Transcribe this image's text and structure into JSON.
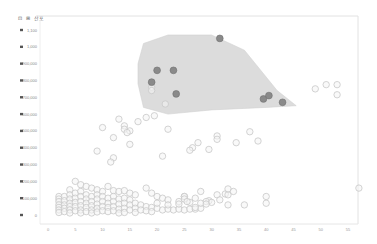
{
  "toolbar": {
    "buttons": [
      {
        "name": "select-tool",
        "icon": "cursor-icon",
        "glyph": "⊡"
      },
      {
        "name": "zoom-tool",
        "icon": "zoom-icon",
        "glyph": "⊞"
      },
      {
        "name": "chart-type",
        "icon": "scatter-icon",
        "label": "산포"
      }
    ]
  },
  "chart_data": {
    "type": "scatter",
    "title": "",
    "xlabel": "",
    "ylabel": "",
    "xlim": [
      0,
      55
    ],
    "ylim": [
      0,
      1100000
    ],
    "x_ticks": [
      0,
      5,
      10,
      15,
      20,
      25,
      30,
      35,
      40,
      45,
      50,
      55
    ],
    "x_tick_labels": [
      "0",
      "5",
      "10",
      "15",
      "20",
      "25",
      "30",
      "35",
      "40",
      "45",
      "50",
      "55"
    ],
    "y_ticks": [
      0,
      100000,
      200000,
      300000,
      400000,
      500000,
      600000,
      700000,
      800000,
      900000,
      1000000,
      1100000
    ],
    "y_tick_labels": [
      "0",
      "100,000",
      "200,000",
      "300,000",
      "400,000",
      "500,000",
      "600,000",
      "700,000",
      "800,000",
      "900,000",
      "1,000",
      "1,100"
    ],
    "grid": false,
    "legend": "none",
    "colors": {
      "point_fill": "#f4f4f4",
      "point_stroke": "#c8c8c8",
      "highlight_fill": "#8a8a8a",
      "highlight_stroke": "#707070",
      "hull_fill": "#dcdcdc"
    },
    "highlight_hull": [
      [
        17.5,
        1020000
      ],
      [
        22,
        1070000
      ],
      [
        30,
        1070000
      ],
      [
        36,
        980000
      ],
      [
        42,
        740000
      ],
      [
        45.5,
        650000
      ],
      [
        40,
        640000
      ],
      [
        30,
        625000
      ],
      [
        22,
        600000
      ],
      [
        17.5,
        640000
      ],
      [
        16.5,
        780000
      ],
      [
        16.5,
        900000
      ]
    ],
    "highlight_points": [
      [
        31.5,
        1050000
      ],
      [
        20,
        860000
      ],
      [
        23,
        860000
      ],
      [
        19,
        790000
      ],
      [
        23.5,
        720000
      ],
      [
        39.5,
        690000
      ],
      [
        40.5,
        710000
      ],
      [
        43,
        670000
      ]
    ],
    "series": [
      {
        "name": "points",
        "points": [
          [
            19,
            760000
          ],
          [
            19,
            740000
          ],
          [
            21.5,
            660000
          ],
          [
            49,
            750000
          ],
          [
            51,
            775000
          ],
          [
            53,
            775000
          ],
          [
            53,
            715000
          ],
          [
            18,
            580000
          ],
          [
            19.5,
            590000
          ],
          [
            13,
            570000
          ],
          [
            16.5,
            555000
          ],
          [
            10,
            520000
          ],
          [
            14,
            530000
          ],
          [
            14,
            510000
          ],
          [
            15,
            500000
          ],
          [
            14.5,
            490000
          ],
          [
            22,
            510000
          ],
          [
            31,
            470000
          ],
          [
            34.5,
            430000
          ],
          [
            38.5,
            440000
          ],
          [
            37,
            495000
          ],
          [
            27.5,
            430000
          ],
          [
            26.5,
            400000
          ],
          [
            26,
            385000
          ],
          [
            29.5,
            390000
          ],
          [
            21,
            350000
          ],
          [
            31,
            450000
          ],
          [
            12,
            460000
          ],
          [
            15,
            420000
          ],
          [
            9,
            380000
          ],
          [
            12,
            340000
          ],
          [
            11.5,
            315000
          ],
          [
            5,
            200000
          ],
          [
            6,
            180000
          ],
          [
            7,
            170000
          ],
          [
            4,
            150000
          ],
          [
            8,
            160000
          ],
          [
            9,
            150000
          ],
          [
            10,
            140000
          ],
          [
            12,
            145000
          ],
          [
            13,
            140000
          ],
          [
            11,
            170000
          ],
          [
            14,
            145000
          ],
          [
            15,
            130000
          ],
          [
            16,
            120000
          ],
          [
            18,
            160000
          ],
          [
            19,
            130000
          ],
          [
            20,
            110000
          ],
          [
            21,
            100000
          ],
          [
            22,
            90000
          ],
          [
            24,
            80000
          ],
          [
            25,
            110000
          ],
          [
            27,
            100000
          ],
          [
            28,
            140000
          ],
          [
            2,
            110000
          ],
          [
            2,
            95000
          ],
          [
            2,
            80000
          ],
          [
            2,
            60000
          ],
          [
            2,
            45000
          ],
          [
            2,
            30000
          ],
          [
            2,
            15000
          ],
          [
            3,
            110000
          ],
          [
            3,
            85000
          ],
          [
            3,
            60000
          ],
          [
            3,
            40000
          ],
          [
            3,
            20000
          ],
          [
            4,
            120000
          ],
          [
            4,
            95000
          ],
          [
            4,
            70000
          ],
          [
            4,
            50000
          ],
          [
            4,
            30000
          ],
          [
            4,
            12000
          ],
          [
            5,
            130000
          ],
          [
            5,
            100000
          ],
          [
            5,
            75000
          ],
          [
            5,
            50000
          ],
          [
            5,
            25000
          ],
          [
            6,
            140000
          ],
          [
            6,
            110000
          ],
          [
            6,
            80000
          ],
          [
            6,
            55000
          ],
          [
            6,
            30000
          ],
          [
            6,
            12000
          ],
          [
            7,
            120000
          ],
          [
            7,
            95000
          ],
          [
            7,
            70000
          ],
          [
            7,
            45000
          ],
          [
            7,
            20000
          ],
          [
            8,
            110000
          ],
          [
            8,
            80000
          ],
          [
            8,
            55000
          ],
          [
            8,
            30000
          ],
          [
            8,
            12000
          ],
          [
            9,
            120000
          ],
          [
            9,
            95000
          ],
          [
            9,
            65000
          ],
          [
            9,
            40000
          ],
          [
            9,
            18000
          ],
          [
            10,
            110000
          ],
          [
            10,
            80000
          ],
          [
            10,
            50000
          ],
          [
            10,
            25000
          ],
          [
            11,
            100000
          ],
          [
            11,
            70000
          ],
          [
            11,
            45000
          ],
          [
            11,
            20000
          ],
          [
            12,
            110000
          ],
          [
            12,
            80000
          ],
          [
            12,
            50000
          ],
          [
            12,
            25000
          ],
          [
            13,
            95000
          ],
          [
            13,
            65000
          ],
          [
            13,
            35000
          ],
          [
            13,
            12000
          ],
          [
            14,
            100000
          ],
          [
            14,
            70000
          ],
          [
            14,
            40000
          ],
          [
            14,
            15000
          ],
          [
            15,
            90000
          ],
          [
            15,
            60000
          ],
          [
            15,
            30000
          ],
          [
            16,
            70000
          ],
          [
            16,
            40000
          ],
          [
            16,
            15000
          ],
          [
            17,
            60000
          ],
          [
            17,
            30000
          ],
          [
            18,
            50000
          ],
          [
            18,
            25000
          ],
          [
            19,
            45000
          ],
          [
            19,
            20000
          ],
          [
            20,
            40000
          ],
          [
            21,
            30000
          ],
          [
            22,
            35000
          ],
          [
            23,
            30000
          ],
          [
            24,
            35000
          ],
          [
            25,
            30000
          ],
          [
            26,
            35000
          ],
          [
            27,
            35000
          ],
          [
            28,
            40000
          ],
          [
            20,
            70000
          ],
          [
            22,
            60000
          ],
          [
            24,
            65000
          ],
          [
            26,
            75000
          ],
          [
            25,
            110000
          ],
          [
            25,
            95000
          ],
          [
            25.5,
            80000
          ],
          [
            27,
            45000
          ],
          [
            28,
            70000
          ],
          [
            29.5,
            85000
          ],
          [
            31,
            120000
          ],
          [
            32.5,
            125000
          ],
          [
            31.5,
            90000
          ],
          [
            33,
            120000
          ],
          [
            33,
            155000
          ],
          [
            34,
            140000
          ],
          [
            40,
            110000
          ],
          [
            40,
            70000
          ],
          [
            57,
            160000
          ],
          [
            36,
            60000
          ],
          [
            29,
            80000
          ],
          [
            30,
            75000
          ],
          [
            29,
            65000
          ],
          [
            33,
            60000
          ]
        ]
      }
    ]
  }
}
